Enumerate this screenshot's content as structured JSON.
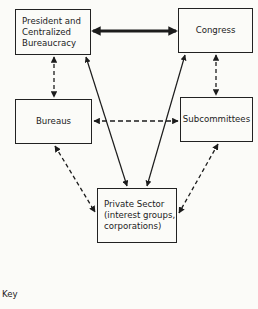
{
  "diagram": {
    "nodes": {
      "president": "President and\nCentralized\nBureaucracy",
      "congress": "Congress",
      "bureaus": "Bureaus",
      "subcommittees": "Subcommittees",
      "private_sector": "Private Sector\n(interest groups,\ncorporations)"
    },
    "edges": [
      {
        "from": "President and Centralized Bureaucracy",
        "to": "Congress",
        "style": "heavy-solid",
        "direction": "both"
      },
      {
        "from": "President and Centralized Bureaucracy",
        "to": "Bureaus",
        "style": "dashed",
        "direction": "both"
      },
      {
        "from": "Congress",
        "to": "Subcommittees",
        "style": "dashed",
        "direction": "both"
      },
      {
        "from": "Bureaus",
        "to": "Subcommittees",
        "style": "dashed",
        "direction": "both"
      },
      {
        "from": "Private Sector",
        "to": "President and Centralized Bureaucracy",
        "style": "solid",
        "direction": "both"
      },
      {
        "from": "Private Sector",
        "to": "Congress",
        "style": "solid",
        "direction": "both"
      },
      {
        "from": "Bureaus",
        "to": "Private Sector",
        "style": "dashed",
        "direction": "both"
      },
      {
        "from": "Subcommittees",
        "to": "Private Sector",
        "style": "dashed",
        "direction": "both"
      }
    ],
    "key_label": "Key"
  }
}
